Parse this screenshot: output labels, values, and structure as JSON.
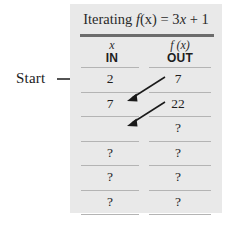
{
  "figure": {
    "annotation": {
      "start_label": "Start",
      "arrow_icon": "arrow-right-icon"
    },
    "panel": {
      "title": {
        "prefix": "Iterating ",
        "function": "f",
        "argument": "(x)",
        "equals": " = 3",
        "variable": "x",
        "constant": " + 1",
        "full_text": "Iterating f(x) = 3x + 1"
      },
      "headers": {
        "in": {
          "variable": "x",
          "word": "IN"
        },
        "out": {
          "variable": "f (x)",
          "word": "OUT"
        }
      },
      "rows": [
        {
          "in": "2",
          "out": "7"
        },
        {
          "in": "7",
          "out": "22"
        },
        {
          "in": "",
          "out": "?"
        },
        {
          "in": "?",
          "out": "?"
        },
        {
          "in": "?",
          "out": "?"
        },
        {
          "in": "?",
          "out": "?"
        }
      ],
      "feedback_arrows": [
        {
          "name": "feedback-arrow-1",
          "from": "out-row-1",
          "to": "in-row-2"
        },
        {
          "name": "feedback-arrow-2",
          "from": "out-row-2",
          "to": "in-row-3"
        }
      ]
    },
    "colors": {
      "panel_background": "#e9e9e9",
      "page_background": "#ffffff",
      "title_rule": "#6c6c6c",
      "row_rule": "#b4b4b4",
      "text": "#1e1e1e",
      "arrow": "#1a1a1a"
    }
  }
}
